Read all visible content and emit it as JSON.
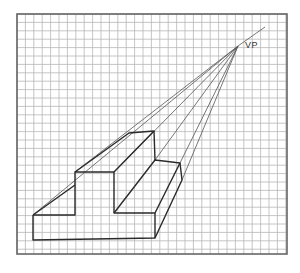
{
  "figure": {
    "vanishing_point_label": "VP",
    "vanishing_point": [
      238,
      46
    ],
    "grid": {
      "left": 17,
      "top": 14,
      "right": 287,
      "bottom": 254,
      "pitch": 8.4,
      "line_color": "#b5b5b5",
      "border_color": "#555555"
    },
    "ink_color": "#2a2a2a"
  }
}
